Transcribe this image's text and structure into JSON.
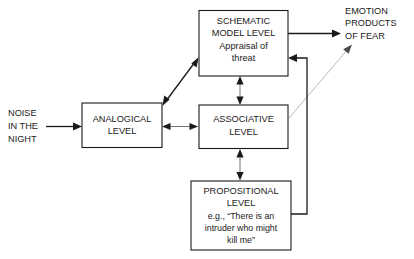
{
  "diagram": {
    "boxes": [
      {
        "id": "schematic",
        "name": "schematic-model-level-box",
        "lines": [
          "SCHEMATIC",
          "MODEL LEVEL",
          "Appraisal of",
          "threat"
        ]
      },
      {
        "id": "analogical",
        "name": "analogical-level-box",
        "lines": [
          "ANALOGICAL",
          "LEVEL"
        ]
      },
      {
        "id": "associative",
        "name": "associative-level-box",
        "lines": [
          "ASSOCIATIVE",
          "LEVEL"
        ]
      },
      {
        "id": "propositional",
        "name": "propositional-level-box",
        "lines": [
          "PROPOSITIONAL",
          "LEVEL",
          "e.g., “There is an",
          "intruder who might",
          "kill me”"
        ]
      }
    ],
    "labels": [
      {
        "id": "input",
        "name": "noise-in-the-night-label",
        "lines": [
          "NOISE",
          "IN THE",
          "NIGHT"
        ]
      },
      {
        "id": "output",
        "name": "emotion-products-of-fear-label",
        "lines": [
          "EMOTION",
          "PRODUCTS",
          "OF FEAR"
        ]
      }
    ],
    "colors": {
      "stroke": "#1a1a1a",
      "thin_stroke": "#3a3a3a",
      "gray_stroke": "#b0b0b0",
      "background": "#ffffff",
      "text": "#1a1a1a"
    }
  }
}
